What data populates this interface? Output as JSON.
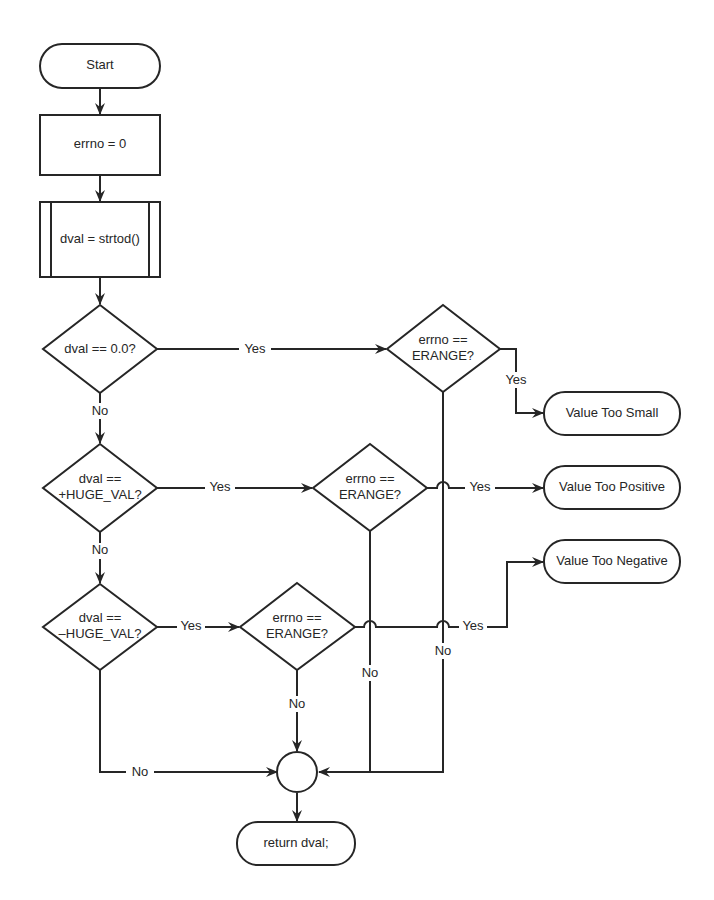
{
  "diagram": {
    "type": "flowchart",
    "nodes": {
      "start": {
        "label": "Start",
        "shape": "terminal"
      },
      "errno_init": {
        "label": "errno = 0",
        "shape": "process"
      },
      "strtod": {
        "label": "dval = strtod()",
        "shape": "predefined-process"
      },
      "check_zero": {
        "line1": "dval == 0.0?",
        "shape": "decision"
      },
      "check_pos": {
        "line1": "dval ==",
        "line2": "+HUGE_VAL?",
        "shape": "decision"
      },
      "check_neg": {
        "line1": "dval ==",
        "line2": "–HUGE_VAL?",
        "shape": "decision"
      },
      "erange1": {
        "line1": "errno ==",
        "line2": "ERANGE?",
        "shape": "decision"
      },
      "erange2": {
        "line1": "errno ==",
        "line2": "ERANGE?",
        "shape": "decision"
      },
      "erange3": {
        "line1": "errno ==",
        "line2": "ERANGE?",
        "shape": "decision"
      },
      "too_small": {
        "label": "Value Too Small",
        "shape": "terminal"
      },
      "too_positive": {
        "label": "Value Too Positive",
        "shape": "terminal"
      },
      "too_negative": {
        "label": "Value Too Negative",
        "shape": "terminal"
      },
      "merge": {
        "label": "",
        "shape": "connector"
      },
      "return": {
        "label": "return dval;",
        "shape": "terminal"
      }
    },
    "edge_labels": {
      "zero_yes": "Yes",
      "zero_no": "No",
      "pos_yes": "Yes",
      "pos_no": "No",
      "neg_yes": "Yes",
      "neg_no": "No",
      "erange1_yes": "Yes",
      "erange1_no": "No",
      "erange2_yes": "Yes",
      "erange2_no": "No",
      "erange3_yes": "Yes",
      "erange3_no": "No"
    },
    "colors": {
      "stroke": "#262626",
      "background": "#ffffff"
    }
  }
}
